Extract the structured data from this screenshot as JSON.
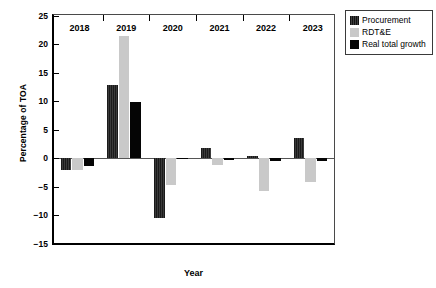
{
  "chart_data": {
    "type": "bar",
    "title": "",
    "xlabel": "Year",
    "ylabel": "Percentage of TOA",
    "categories": [
      "2018",
      "2019",
      "2020",
      "2021",
      "2022",
      "2023"
    ],
    "ylim": [
      -15,
      25
    ],
    "yticks": [
      25,
      20,
      15,
      10,
      5,
      0,
      -5,
      -10,
      -15
    ],
    "ytick_labels": [
      "25",
      "20",
      "15",
      "10",
      "5",
      "0",
      "−5",
      "−10",
      "−15"
    ],
    "grid": false,
    "legend_position": "top-right outside",
    "series": [
      {
        "name": "Procurement",
        "color": "#262626",
        "pattern": "vertical-stripe",
        "values": [
          -2.0,
          12.9,
          -10.5,
          1.8,
          0.4,
          3.6
        ]
      },
      {
        "name": "RDT&E",
        "color": "#c9c9c9",
        "pattern": "solid",
        "values": [
          -2.0,
          21.5,
          -4.7,
          -1.2,
          -5.8,
          -4.2
        ]
      },
      {
        "name": "Real total growth",
        "color": "#050505",
        "pattern": "solid",
        "values": [
          -1.3,
          9.9,
          0.15,
          -0.3,
          -0.5,
          -0.4
        ]
      }
    ]
  },
  "legend": {
    "items": [
      {
        "label": "Procurement",
        "swatch": "procurement"
      },
      {
        "label": "RDT&E",
        "swatch": "rdte"
      },
      {
        "label": "Real total growth",
        "swatch": "total"
      }
    ]
  }
}
